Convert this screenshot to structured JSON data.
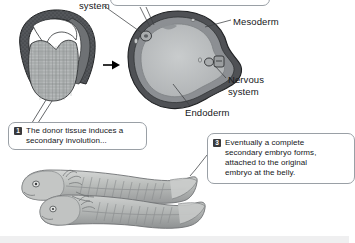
{
  "figure": {
    "title_visible": false,
    "background_color": "#ffffff",
    "bottom_band_color": "#efeff0"
  },
  "labels": [
    {
      "id": "nervous-system-top",
      "text": "system",
      "x": 79,
      "y": 1
    },
    {
      "id": "mesoderm",
      "text": "Mesoderm",
      "x": 233,
      "y": 18
    },
    {
      "id": "nervous-system-right-line1",
      "text": "Nervous",
      "x": 228,
      "y": 76
    },
    {
      "id": "nervous-system-right-line2",
      "text": "system",
      "x": 228,
      "y": 88
    },
    {
      "id": "endoderm",
      "text": "Endoderm",
      "x": 185,
      "y": 110
    }
  ],
  "callouts": [
    {
      "id": "callout-top-cropped",
      "number": "",
      "lines": [],
      "x": 110,
      "y": -14,
      "width": 160,
      "height": 20,
      "cropped": true
    },
    {
      "id": "callout-1",
      "number": "1",
      "lines": [
        "The donor tissue induces a",
        "secondary involution..."
      ],
      "x": 8,
      "y": 122,
      "width": 139,
      "height": 28,
      "cropped": false
    },
    {
      "id": "callout-3",
      "number": "3",
      "lines": [
        "Eventually a complete",
        "secondary embryo forms,",
        "attached to the original",
        "embryo at the belly."
      ],
      "x": 207,
      "y": 133,
      "width": 148,
      "height": 51,
      "cropped": true
    }
  ],
  "drawings": [
    {
      "id": "gastrula-section",
      "name": "gastrula-cross-section",
      "description": "Early gastrula sagittal section with blastocoel cavity and cellular yolk mass"
    },
    {
      "id": "neurula-section",
      "name": "neurula-cross-section",
      "description": "Transverse section showing ectoderm, mesoderm, endoderm and two neural tubes"
    },
    {
      "id": "conjoined-tadpoles",
      "name": "conjoined-tadpole-embryos",
      "description": "Two tadpole larvae joined at the belly, primary and secondary embryo"
    }
  ],
  "arrow": {
    "id": "process-arrow",
    "direction": "right",
    "x": 104,
    "y": 61
  },
  "colors": {
    "outline": "#2b2b2d",
    "ectoderm": "#55575a",
    "mesoderm": "#8d9094",
    "endoderm": "#b9bcbd",
    "callout_border": "#9aa0a6",
    "badge": "#3a3a3c",
    "leader_line": "#3c3f42"
  }
}
